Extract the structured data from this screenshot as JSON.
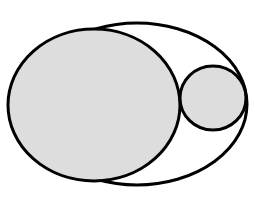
{
  "diagram": {
    "colors": {
      "background": "#ffffff",
      "stroke": "#000000",
      "fill": "#dddddd"
    },
    "stroke_width": 3,
    "shapes": {
      "outer_ellipse": {
        "cx": 137,
        "cy": 104,
        "rx": 110,
        "ry": 81,
        "filled": false
      },
      "large_ellipse": {
        "cx": 94,
        "cy": 105,
        "rx": 86,
        "ry": 76,
        "filled": true
      },
      "small_circle": {
        "cx": 213,
        "cy": 98,
        "rx": 33,
        "ry": 32,
        "filled": true
      }
    }
  }
}
